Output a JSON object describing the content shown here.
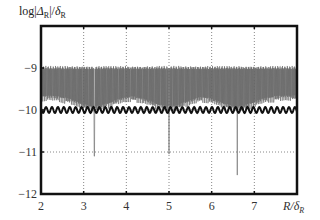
{
  "chart_data": {
    "type": "line",
    "title": "",
    "ylabel": "log|Δ_R|/δ_R",
    "xlabel": "R/δ_R",
    "xlim": [
      2,
      8
    ],
    "ylim": [
      -12,
      -8
    ],
    "x_ticks": [
      "2",
      "3",
      "4",
      "5",
      "6",
      "7"
    ],
    "y_ticks": [
      "-9",
      "-10",
      "-11",
      "-12"
    ],
    "grid": "dotted",
    "legend": null,
    "series": [
      {
        "name": "thin oscillating line",
        "style": "thin grey",
        "description": "dense oscillation between about -9.0 and -9.8, with deep dips near R/δ_R ≈ 3.25 (-11.1), 5.0 (-11.05), 6.6 (-11.55)",
        "upper_envelope": -8.95,
        "lower_envelope_base": -9.8,
        "dips": [
          {
            "x": 3.25,
            "y": -11.1
          },
          {
            "x": 5.0,
            "y": -11.05
          },
          {
            "x": 6.6,
            "y": -11.55
          }
        ]
      },
      {
        "name": "thick oscillating line",
        "style": "thick black",
        "description": "small regular oscillation centered near -10",
        "center": -10.0,
        "amplitude": 0.07
      }
    ]
  },
  "labels": {
    "y_axis_prefix": "log|",
    "y_axis_delta": "Δ",
    "y_axis_sub1": "R",
    "y_axis_mid": "|/",
    "y_axis_delta2": "δ",
    "y_axis_sub2": "R",
    "x_axis": "R/δ",
    "x_axis_sub": "R"
  }
}
